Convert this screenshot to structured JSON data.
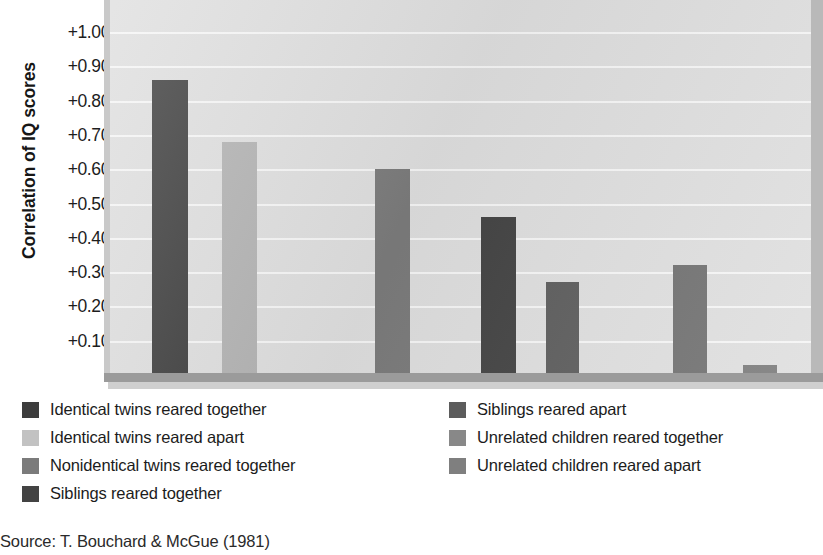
{
  "chart_data": {
    "type": "bar",
    "title": "",
    "xlabel": "",
    "ylabel": "Correlation of IQ scores",
    "ylim": [
      0,
      1.05
    ],
    "grid": true,
    "legend_position": "below",
    "ytick_labels": [
      "+1.00",
      "+0.90",
      "+0.80",
      "+0.70",
      "+0.60",
      "+0.50",
      "+0.40",
      "+0.30",
      "+0.20",
      "+0.10"
    ],
    "ytick_values": [
      1.0,
      0.9,
      0.8,
      0.7,
      0.6,
      0.5,
      0.4,
      0.3,
      0.2,
      0.1
    ],
    "categories": [
      "Identical twins reared together",
      "Identical twins reared apart",
      "Nonidentical twins reared together",
      "Siblings reared together",
      "Siblings reared apart",
      "Unrelated children reared together",
      "Unrelated children reared apart"
    ],
    "values": [
      0.86,
      0.68,
      0.6,
      0.46,
      0.27,
      0.32,
      0.03
    ],
    "colors": [
      "#3d3d3d",
      "#b2b2b2",
      "#7b7b7b",
      "#434343",
      "#5c5c5c",
      "#6f6f6f",
      "#797979"
    ]
  },
  "axis": {
    "y_title": "Correlation of IQ scores"
  },
  "legend": {
    "left_items": [
      {
        "label": "Identical twins reared together",
        "color": "#3d3d3d"
      },
      {
        "label": "Identical twins reared apart",
        "color": "#c2c2c2"
      },
      {
        "label": "Nonidentical twins reared together",
        "color": "#7b7b7b"
      },
      {
        "label": "Siblings reared together",
        "color": "#434343"
      }
    ],
    "right_items": [
      {
        "label": "Siblings reared apart",
        "color": "#5c5c5c"
      },
      {
        "label": "Unrelated children reared together",
        "color": "#888888"
      },
      {
        "label": "Unrelated children reared apart",
        "color": "#7f7f7f"
      }
    ]
  },
  "source": {
    "text": "Source: T. Bouchard & McGue (1981)"
  }
}
